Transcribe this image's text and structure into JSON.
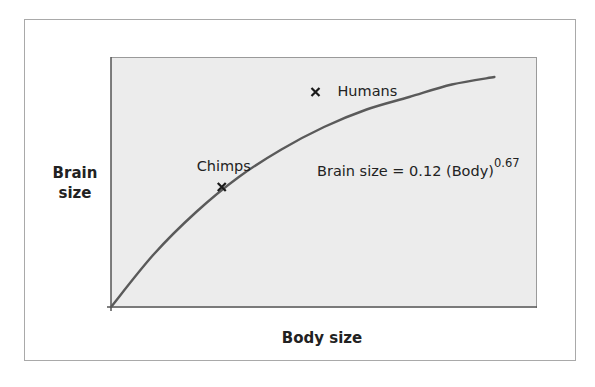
{
  "chart_data": {
    "type": "line",
    "title": "",
    "xlabel": "Body size",
    "ylabel_lines": [
      "Brain",
      "size"
    ],
    "xlim": [
      0,
      1
    ],
    "ylim": [
      0,
      1
    ],
    "grid": false,
    "series": [
      {
        "name": "Brain size = 0.12 (Body)^0.67",
        "kind": "curve",
        "x": [
          0.0,
          0.1,
          0.2,
          0.3,
          0.4,
          0.5,
          0.6,
          0.7,
          0.8,
          0.9
        ],
        "y": [
          0.0,
          0.21,
          0.38,
          0.52,
          0.63,
          0.72,
          0.79,
          0.84,
          0.89,
          0.92
        ]
      },
      {
        "name": "species",
        "kind": "scatter",
        "points": [
          {
            "label": "Chimps",
            "x": 0.26,
            "y": 0.48
          },
          {
            "label": "Humans",
            "x": 0.48,
            "y": 0.86
          }
        ]
      }
    ],
    "annotations": {
      "equation_main": "Brain size = 0.12 (Body)",
      "equation_exponent": "0.67"
    }
  }
}
